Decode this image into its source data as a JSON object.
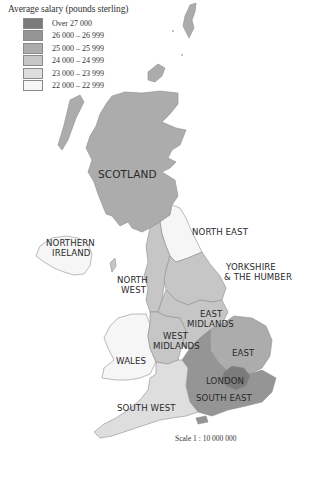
{
  "legend": {
    "title": "Average salary (pounds sterling)",
    "items": [
      {
        "label": "Over 27 000",
        "color": "#7b7b7b"
      },
      {
        "label": "26 000 – 26 999",
        "color": "#959595"
      },
      {
        "label": "25 000 – 25 999",
        "color": "#acacac"
      },
      {
        "label": "24 000 – 24 999",
        "color": "#c6c6c6"
      },
      {
        "label": "23 000 – 23 999",
        "color": "#dedede"
      },
      {
        "label": "22 000 – 22 999",
        "color": "#f6f6f6"
      }
    ]
  },
  "regions": {
    "scotland": {
      "label": "SCOTLAND",
      "band": "25 000 – 25 999"
    },
    "north_east": {
      "label": "NORTH EAST",
      "band": "22 000 – 22 999"
    },
    "northern_ireland": {
      "label_line1": "NORTHERN",
      "label_line2": "IRELAND",
      "band": "22 000 – 22 999"
    },
    "yorkshire": {
      "label_line1": "YORKSHIRE",
      "label_line2": "& THE HUMBER",
      "band": "24 000 – 24 999"
    },
    "north_west": {
      "label_line1": "NORTH",
      "label_line2": "WEST",
      "band": "24 000 – 24 999"
    },
    "east_midlands": {
      "label_line1": "EAST",
      "label_line2": "MIDLANDS",
      "band": "24 000 – 24 999"
    },
    "west_midlands": {
      "label_line1": "WEST",
      "label_line2": "MIDLANDS",
      "band": "24 000 – 24 999"
    },
    "wales": {
      "label": "WALES",
      "band": "22 000 – 22 999"
    },
    "east": {
      "label": "EAST",
      "band": "25 000 – 25 999"
    },
    "london": {
      "label": "LONDON",
      "band": "Over 27 000"
    },
    "south_east": {
      "label": "SOUTH EAST",
      "band": "26 000 – 26 999"
    },
    "south_west": {
      "label": "SOUTH WEST",
      "band": "23 000 – 23 999"
    }
  },
  "scale": {
    "text": "Scale 1 : 10 000 000"
  }
}
